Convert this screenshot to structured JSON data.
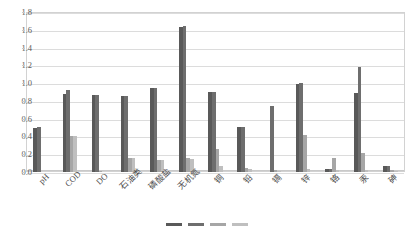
{
  "chart_data": {
    "type": "bar",
    "title": "",
    "subtitle": "",
    "xlabel": "",
    "ylabel": "",
    "ylim": [
      0.0,
      1.8
    ],
    "ytick_step": 0.2,
    "yticks": [
      "0.0",
      "0.2",
      "0.4",
      "0.6",
      "0.8",
      "1.0",
      "1.2",
      "1.4",
      "1.6",
      "1.8"
    ],
    "grid": true,
    "legend_position": "bottom",
    "categories": [
      "pH",
      "COD",
      "DO",
      "石油类",
      "磷酸盐",
      "无机氮",
      "铜",
      "铅",
      "镉",
      "锌",
      "铬",
      "汞",
      "砷"
    ],
    "series": [
      {
        "name": "series-1",
        "color": "#595959",
        "values": [
          0.5,
          0.88,
          0.87,
          0.86,
          0.94,
          1.63,
          0.9,
          0.51,
          0.0,
          0.99,
          0.03,
          0.89,
          0.07
        ]
      },
      {
        "name": "series-2",
        "color": "#6e6e6e",
        "values": [
          0.51,
          0.92,
          0.87,
          0.86,
          0.95,
          1.64,
          0.9,
          0.51,
          0.74,
          1.0,
          0.03,
          1.18,
          0.07
        ]
      },
      {
        "name": "series-3",
        "color": "#a6a6a6",
        "values": [
          0.0,
          0.41,
          0.01,
          0.16,
          0.14,
          0.16,
          0.26,
          0.04,
          0.02,
          0.42,
          0.16,
          0.21,
          0.02
        ]
      },
      {
        "name": "series-4",
        "color": "#bfbfbf",
        "values": [
          0.0,
          0.41,
          0.0,
          0.16,
          0.14,
          0.15,
          0.07,
          0.03,
          0.01,
          0.03,
          0.02,
          0.02,
          0.01
        ]
      }
    ],
    "legend_colors": [
      "#595959",
      "#6e6e6e",
      "#a6a6a6",
      "#bfbfbf"
    ]
  }
}
